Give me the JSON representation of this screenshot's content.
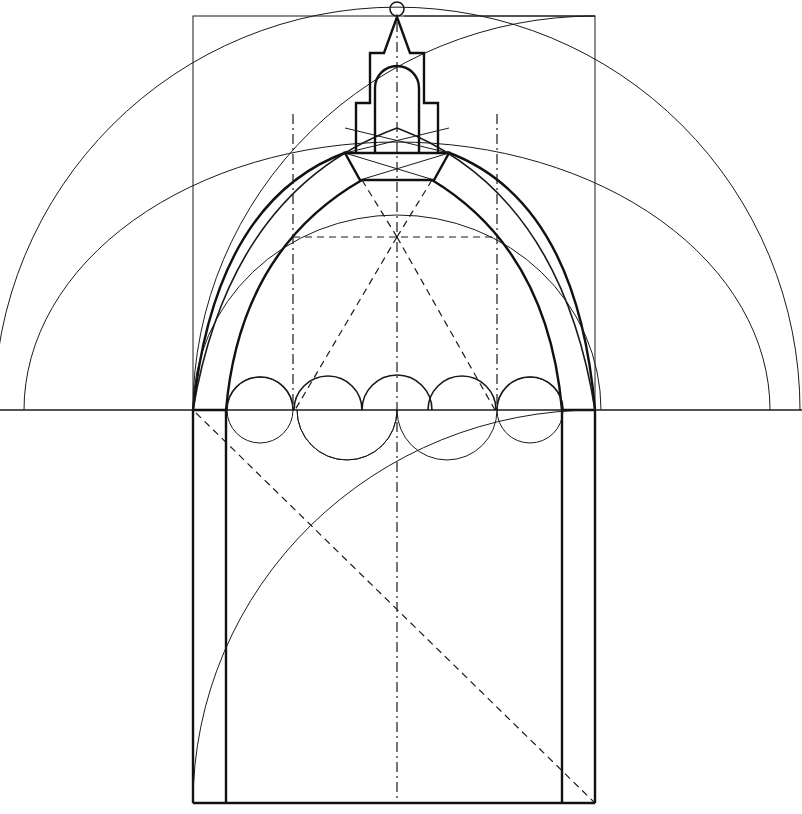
{
  "figure": {
    "colors": {
      "ink": "#1a1a1a",
      "background": "#ffffff"
    },
    "elements": {
      "springing_line_y": 410,
      "frame_rect": {
        "x1": 193,
        "y1": 16,
        "x2": 595,
        "y2": 803
      },
      "inner_walls_x": [
        226,
        562
      ],
      "axis_x": 397,
      "dashdot_verticals_x": [
        293,
        497
      ],
      "circles_row": {
        "count": 5,
        "radius": 33,
        "centers_x": [
          260,
          329,
          397,
          465,
          532
        ]
      },
      "outer_arcs": [
        {
          "r": 403
        },
        {
          "r": 370
        }
      ],
      "lantern_finial_center": [
        397,
        9
      ]
    }
  }
}
